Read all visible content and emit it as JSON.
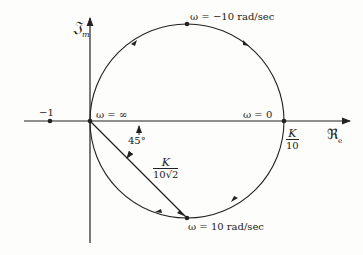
{
  "diagram": {
    "type": "nyquist-plot",
    "axes": {
      "imag_label": "𝔍",
      "imag_sub": "m",
      "real_label": "ℜ",
      "real_sub": "e"
    },
    "points": {
      "minus_one": "−1",
      "omega_inf": "ω = ∞",
      "omega_zero": "ω = 0",
      "omega_minus10": "ω = −10 rad/sec",
      "omega_plus10": "ω = 10 rad/sec"
    },
    "annotations": {
      "angle": "45°",
      "k_over_10_num": "K",
      "k_over_10_den": "10",
      "chord_num": "K",
      "chord_den": "10√2"
    }
  }
}
